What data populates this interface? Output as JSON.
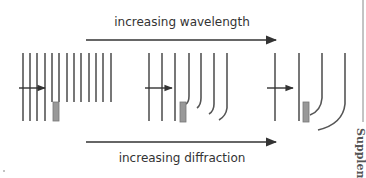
{
  "diagram": {
    "top_label": "increasing wavelength",
    "bottom_label": "increasing diffraction",
    "side_label": "Supplement",
    "colors": {
      "line": "#555555",
      "arrow": "#333333",
      "barrier_fill": "#999999",
      "barrier_stroke": "#777777",
      "text": "#333333"
    },
    "panels": [
      {
        "name": "short-wavelength",
        "wavefront_count": 12,
        "diffraction": "minimal"
      },
      {
        "name": "medium-wavelength",
        "wavefront_count": 7,
        "diffraction": "moderate"
      },
      {
        "name": "long-wavelength",
        "wavefront_count": 4,
        "diffraction": "strong"
      }
    ]
  }
}
